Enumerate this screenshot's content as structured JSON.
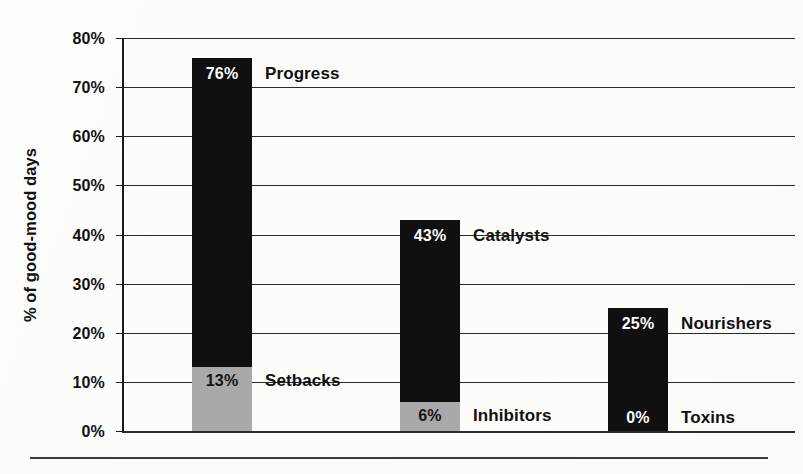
{
  "chart_data": {
    "type": "bar",
    "title": "",
    "subtitle": "",
    "xlabel": "",
    "ylabel": "% of good-mood days",
    "ylim": [
      0,
      80
    ],
    "grid": true,
    "legend_position": "inline-right-of-bars",
    "stacked": true,
    "y_ticks": [
      "0%",
      "10%",
      "20%",
      "30%",
      "40%",
      "50%",
      "60%",
      "70%",
      "80%"
    ],
    "y_tick_values": [
      0,
      10,
      20,
      30,
      40,
      50,
      60,
      70,
      80
    ],
    "categories": [
      "Group 1",
      "Group 2",
      "Group 3"
    ],
    "series": [
      {
        "name": "positive",
        "color": "#111010",
        "values": [
          76,
          43,
          25
        ],
        "labels": [
          "76%",
          "43%",
          "25%"
        ],
        "names": [
          "Progress",
          "Catalysts",
          "Nourishers"
        ]
      },
      {
        "name": "negative",
        "color": "#a9a9a9",
        "values": [
          13,
          6,
          0
        ],
        "labels": [
          "13%",
          "6%",
          "0%"
        ],
        "names": [
          "Setbacks",
          "Inhibitors",
          "Toxins"
        ]
      }
    ],
    "bars": [
      {
        "index": 0,
        "top_label": "76%",
        "top_name": "Progress",
        "top_value": 76,
        "bottom_label": "13%",
        "bottom_name": "Setbacks",
        "bottom_value": 13
      },
      {
        "index": 1,
        "top_label": "43%",
        "top_name": "Catalysts",
        "top_value": 43,
        "bottom_label": "6%",
        "bottom_name": "Inhibitors",
        "bottom_value": 6
      },
      {
        "index": 2,
        "top_label": "25%",
        "top_name": "Nourishers",
        "top_value": 25,
        "bottom_label": "0%",
        "bottom_name": "Toxins",
        "bottom_value": 0
      }
    ]
  },
  "axis": {
    "title": "% of good-mood days",
    "ticks": [
      {
        "label": "80%",
        "value": 80
      },
      {
        "label": "70%",
        "value": 70
      },
      {
        "label": "60%",
        "value": 60
      },
      {
        "label": "50%",
        "value": 50
      },
      {
        "label": "40%",
        "value": 40
      },
      {
        "label": "30%",
        "value": 30
      },
      {
        "label": "20%",
        "value": 20
      },
      {
        "label": "10%",
        "value": 10
      },
      {
        "label": "0%",
        "value": 0
      }
    ]
  },
  "colors": {
    "black_segment": "#111010",
    "gray_segment": "#a9a9a9",
    "gridline": "#2a2a2a",
    "text": "#111111",
    "background": "#fdfdfb"
  }
}
